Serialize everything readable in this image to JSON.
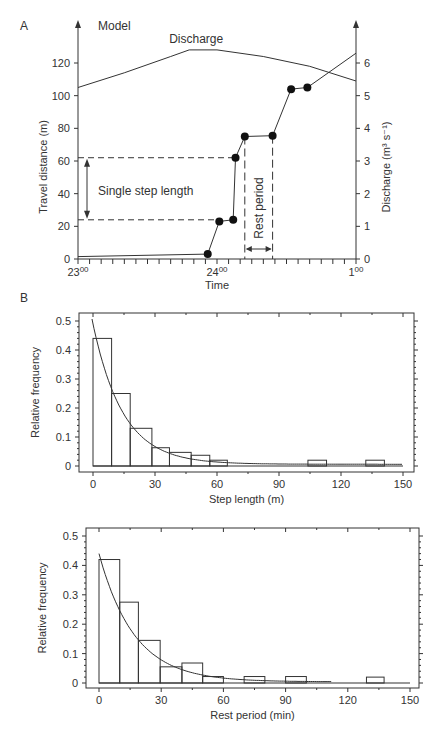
{
  "chart_data": [
    {
      "panel": "A",
      "type": "line",
      "title": "Model",
      "xlabel": "Time",
      "ylabel": "Travel distance (m)",
      "y2label": "Discharge (m³ s⁻¹)",
      "x_ticks": [
        {
          "minutes": 0,
          "label_main": "23",
          "label_sup": "00"
        },
        {
          "minutes": 60,
          "label_main": "24",
          "label_sup": "00"
        },
        {
          "minutes": 120,
          "label_main": "1",
          "label_sup": "00"
        }
      ],
      "x_minor_tick_step_min": 5,
      "xlim_minutes": [
        0,
        120
      ],
      "ylim": [
        0,
        120
      ],
      "y_ticks": [
        0,
        20,
        40,
        60,
        80,
        100,
        120
      ],
      "y2lim": [
        0,
        6
      ],
      "y2_ticks": [
        0,
        1,
        2,
        3,
        4,
        5,
        6
      ],
      "series": [
        {
          "name": "Travel distance",
          "axis": "left",
          "points": [
            {
              "t": 0,
              "d": 1.5,
              "marker": false
            },
            {
              "t": 56,
              "d": 3,
              "marker": true
            },
            {
              "t": 61,
              "d": 23,
              "marker": true
            },
            {
              "t": 67,
              "d": 24,
              "marker": true
            },
            {
              "t": 68,
              "d": 62,
              "marker": true
            },
            {
              "t": 72,
              "d": 75,
              "marker": true
            },
            {
              "t": 84,
              "d": 75.5,
              "marker": true
            },
            {
              "t": 92,
              "d": 104,
              "marker": true
            },
            {
              "t": 99,
              "d": 105,
              "marker": true
            },
            {
              "t": 120,
              "d": 126,
              "marker": false
            }
          ]
        },
        {
          "name": "Discharge",
          "axis": "right",
          "label": "Discharge",
          "points": [
            {
              "t": 0,
              "q": 5.25
            },
            {
              "t": 20,
              "q": 5.7
            },
            {
              "t": 40,
              "q": 6.2
            },
            {
              "t": 48,
              "q": 6.4
            },
            {
              "t": 60,
              "q": 6.4
            },
            {
              "t": 80,
              "q": 6.2
            },
            {
              "t": 100,
              "q": 5.9
            },
            {
              "t": 120,
              "q": 5.45
            }
          ]
        }
      ],
      "annotations": {
        "step_label": "Single step length",
        "step_from": 24,
        "step_to": 62,
        "rest_label": "Rest period",
        "rest_from": 72,
        "rest_to": 84
      }
    },
    {
      "panel": "B",
      "type": "bar",
      "xlabel": "Step length (m)",
      "ylabel": "Relative frequency",
      "xlim": [
        -5,
        155
      ],
      "ylim": [
        0,
        0.52
      ],
      "x_ticks": [
        0,
        30,
        60,
        90,
        120,
        150
      ],
      "y_ticks": [
        0,
        0.1,
        0.2,
        0.3,
        0.4,
        0.5
      ],
      "y_tick_labels": [
        "0",
        "0.1",
        "0.2",
        "0.3",
        "0.4",
        "0.5"
      ],
      "bins": [
        {
          "from": 0,
          "to": 9,
          "value": 0.44
        },
        {
          "from": 9,
          "to": 18,
          "value": 0.25
        },
        {
          "from": 18,
          "to": 28.5,
          "value": 0.13
        },
        {
          "from": 28.5,
          "to": 37,
          "value": 0.063
        },
        {
          "from": 37,
          "to": 47.5,
          "value": 0.047
        },
        {
          "from": 47.5,
          "to": 56.5,
          "value": 0.037
        },
        {
          "from": 56.5,
          "to": 65,
          "value": 0.02
        },
        {
          "from": 104,
          "to": 113,
          "value": 0.02
        },
        {
          "from": 132,
          "to": 141,
          "value": 0.02
        }
      ],
      "fit": {
        "type": "exponential",
        "a": 0.49,
        "scale": 14.5,
        "x_from": -0.5,
        "x_to": 150,
        "floor": 0.006
      }
    },
    {
      "panel": "C",
      "type": "bar",
      "xlabel": "Rest period (min)",
      "ylabel": "Relative frequency",
      "xlim": [
        -5,
        155
      ],
      "ylim": [
        0,
        0.52
      ],
      "x_ticks": [
        0,
        30,
        60,
        90,
        120,
        150
      ],
      "y_ticks": [
        0,
        0.1,
        0.2,
        0.3,
        0.4,
        0.5
      ],
      "y_tick_labels": [
        "0",
        "0.1",
        "0.2",
        "0.3",
        "0.4",
        "0.5"
      ],
      "bins": [
        {
          "from": 0,
          "to": 10,
          "value": 0.42
        },
        {
          "from": 10,
          "to": 19,
          "value": 0.275
        },
        {
          "from": 19,
          "to": 29.5,
          "value": 0.145
        },
        {
          "from": 29.5,
          "to": 40,
          "value": 0.055
        },
        {
          "from": 40,
          "to": 50,
          "value": 0.068
        },
        {
          "from": 50,
          "to": 60,
          "value": 0.022
        },
        {
          "from": 70,
          "to": 80,
          "value": 0.022
        },
        {
          "from": 90,
          "to": 100,
          "value": 0.022
        },
        {
          "from": 129,
          "to": 137.5,
          "value": 0.02
        }
      ],
      "fit": {
        "type": "exponential",
        "a": 0.44,
        "scale": 17,
        "x_from": 0,
        "x_to": 112,
        "floor": 0.004
      },
      "baseline_to": 150
    }
  ]
}
